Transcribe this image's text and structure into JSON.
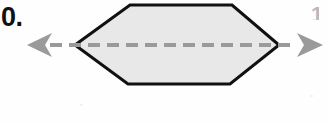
{
  "figure": {
    "item_number": "0.",
    "clipped_right_mark": "1",
    "background_color": "#fefefe",
    "width": 329,
    "height": 122
  },
  "shape": {
    "name": "hexagon",
    "fill_color": "#e8e8e8",
    "stroke_color": "#111111",
    "stroke_width": 3,
    "points": "75,45 130,5 232,5 279,45 230,84 128,84"
  },
  "axis": {
    "name": "axis-of-symmetry",
    "line_color": "#9a9a9a",
    "line_width": 4,
    "dash_length": 12,
    "dash_gap": 7,
    "y": 45,
    "x_start": 50,
    "x_end": 292,
    "left_arrow": {
      "color": "#9a9a9a",
      "tip_x": 27,
      "points": "27,45 52,33 45,45 52,57"
    },
    "right_arrow": {
      "color": "#9a9a9a",
      "tip_x": 323,
      "points": "323,45 297,33 304,45 297,57"
    }
  }
}
